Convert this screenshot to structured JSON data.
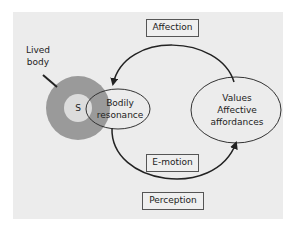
{
  "diagram": {
    "colors": {
      "background": "#ffffff",
      "panel": "#ececec",
      "ring": "#9a9a9a",
      "inner_circle": "#dcdcdc",
      "stroke": "#222222"
    },
    "nodes": {
      "lived_body": {
        "line1": "Lived",
        "line2": "body"
      },
      "self": {
        "label": "S"
      },
      "bodily_resonance": {
        "line1": "Bodily",
        "line2": "resonance"
      },
      "values": {
        "line1": "Values",
        "line2": "Affective",
        "line3": "affordances"
      }
    },
    "edges": {
      "affection": {
        "label": "Affection",
        "from": "values",
        "to": "bodily_resonance"
      },
      "emotion": {
        "label": "E-motion",
        "from": "bodily_resonance",
        "to": "values"
      }
    },
    "boxes": {
      "perception": {
        "label": "Perception"
      }
    }
  }
}
